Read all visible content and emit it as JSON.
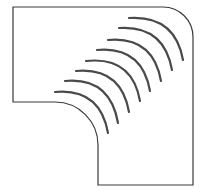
{
  "figure": {
    "stroke_color": "#3a3a3a",
    "slot_color": "#4a4a4a",
    "background": "#ffffff",
    "slot_count": 8
  }
}
